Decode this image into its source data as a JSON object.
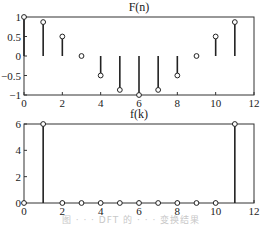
{
  "chart_data": [
    {
      "type": "stem",
      "title": "F(n)",
      "xlabel": "",
      "ylabel": "",
      "xlim": [
        0,
        12
      ],
      "ylim": [
        -1,
        1
      ],
      "xticks": [
        "0",
        "2",
        "4",
        "6",
        "8",
        "10",
        "12"
      ],
      "yticks": [
        "1",
        "0.5",
        "0",
        "-0.5",
        "-1"
      ],
      "grid": false,
      "x": [
        0,
        1,
        2,
        3,
        4,
        5,
        6,
        7,
        8,
        9,
        10,
        11
      ],
      "values": [
        1,
        0.87,
        0.5,
        0,
        -0.5,
        -0.87,
        -1,
        -0.87,
        -0.5,
        0,
        0.5,
        0.87
      ]
    },
    {
      "type": "stem",
      "title": "f(k)",
      "xlabel": "",
      "ylabel": "",
      "xlim": [
        0,
        12
      ],
      "ylim": [
        0,
        6
      ],
      "xticks": [
        "0",
        "2",
        "4",
        "6",
        "8",
        "10",
        "12"
      ],
      "yticks": [
        "6",
        "4",
        "2",
        "0"
      ],
      "grid": false,
      "x": [
        0,
        1,
        2,
        3,
        4,
        5,
        6,
        7,
        8,
        9,
        10,
        11
      ],
      "values": [
        0,
        6,
        0,
        0,
        0,
        0,
        0,
        0,
        0,
        0,
        0,
        6
      ]
    }
  ],
  "caption": "图 · · · DFT 的 · · · 变换结果"
}
